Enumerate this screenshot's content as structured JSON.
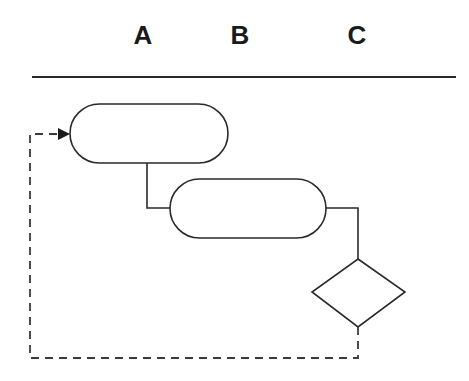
{
  "columns": [
    {
      "label": "A",
      "x": 143
    },
    {
      "label": "B",
      "x": 240
    },
    {
      "label": "C",
      "x": 357
    }
  ],
  "diagram": {
    "type": "flowchart",
    "stroke_color": "#2a2a2a",
    "nodes": [
      {
        "id": "stadium-1",
        "shape": "stadium",
        "text": ""
      },
      {
        "id": "stadium-2",
        "shape": "stadium",
        "text": ""
      },
      {
        "id": "decision",
        "shape": "diamond",
        "text": ""
      }
    ],
    "edges": [
      {
        "from": "stadium-1",
        "to": "stadium-2",
        "style": "solid"
      },
      {
        "from": "stadium-2",
        "to": "decision",
        "style": "solid"
      },
      {
        "from": "decision",
        "to": "stadium-1",
        "style": "dashed",
        "arrow": true
      }
    ]
  }
}
